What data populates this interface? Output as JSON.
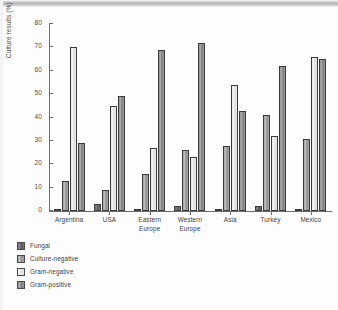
{
  "chart_data": {
    "type": "bar",
    "title": "",
    "xlabel": "",
    "ylabel": "Culture results (%)",
    "ylim": [
      0,
      80
    ],
    "yticks": [
      0,
      10,
      20,
      30,
      40,
      50,
      60,
      70,
      80
    ],
    "grid": false,
    "legend_position": "below-left",
    "categories": [
      "Argentina",
      "USA",
      "Eastern Europe",
      "Western Europe",
      "Asia",
      "Turkey",
      "Mexico"
    ],
    "series": [
      {
        "name": "Fungal",
        "color": "#6e6e6e",
        "values": [
          0.5,
          3,
          1,
          2,
          1,
          2,
          0.5
        ]
      },
      {
        "name": "Culture-negative",
        "color": "#a8a8a8",
        "values": [
          13,
          9,
          16,
          26,
          28,
          41,
          31
        ]
      },
      {
        "name": "Gram-negative",
        "color": "#eaeaea",
        "values": [
          70,
          45,
          27,
          23,
          54,
          32,
          66
        ]
      },
      {
        "name": "Gram-positive",
        "color": "#969696",
        "values": [
          29,
          49,
          69,
          72,
          43,
          62,
          65
        ]
      }
    ]
  },
  "axis": {
    "y_label": "Culture results (%)",
    "y_ticks": [
      "0",
      "10",
      "20",
      "30",
      "40",
      "50",
      "60",
      "70",
      "80"
    ]
  },
  "categories": [
    {
      "line1": "Argentina",
      "line2": ""
    },
    {
      "line1": "USA",
      "line2": ""
    },
    {
      "line1": "Eastern",
      "line2": "Europe"
    },
    {
      "line1": "Western",
      "line2": "Europe"
    },
    {
      "line1": "Asia",
      "line2": ""
    },
    {
      "line1": "Turkey",
      "line2": ""
    },
    {
      "line1": "Mexico",
      "line2": ""
    }
  ],
  "legend": {
    "items": [
      {
        "label": "Fungal"
      },
      {
        "label": "Culture-negative"
      },
      {
        "label": "Gram-negative"
      },
      {
        "label": "Gram-positive"
      }
    ]
  }
}
